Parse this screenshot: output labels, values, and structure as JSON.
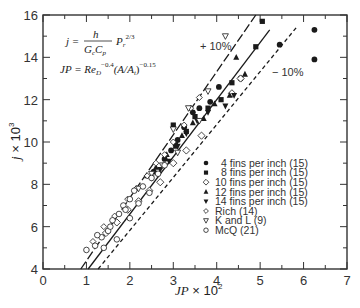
{
  "chart_data": {
    "type": "scatter",
    "title": "",
    "xlabel": "JP × 10²",
    "ylabel": "j × 10³",
    "xlim": [
      0,
      7
    ],
    "ylim": [
      4,
      16
    ],
    "xticks": [
      0,
      1,
      2,
      3,
      4,
      5,
      6,
      7
    ],
    "yticks": [
      4,
      6,
      8,
      10,
      12,
      14,
      16
    ],
    "grid": false,
    "legend_position": "lower right (inside)",
    "annotations": {
      "formula_j": "j = h / (G_c C_p) · P_r^(2/3)",
      "formula_jp": "JP = Re_D^-0.4 (A/A_t)^-0.15",
      "plus10": "+ 10%",
      "minus10": "− 10%"
    },
    "lines": [
      {
        "name": "+10%",
        "style": "long-dash",
        "x": [
          0.87,
          4.9
        ],
        "y": [
          4,
          16
        ]
      },
      {
        "name": "fit",
        "style": "solid",
        "x": [
          1.04,
          5.22
        ],
        "y": [
          4,
          15.3
        ]
      },
      {
        "name": "-10%",
        "style": "short-dash",
        "x": [
          1.27,
          5.83
        ],
        "y": [
          4,
          15.4
        ]
      }
    ],
    "series": [
      {
        "name": "4 fins per inch (15)",
        "marker": "circle-filled",
        "x": [
          2.55,
          2.8,
          2.95,
          3.1,
          3.25,
          3.45,
          3.6,
          3.85,
          4.05,
          4.55,
          5.45,
          6.25,
          6.25
        ],
        "y": [
          8.6,
          9.2,
          9.6,
          10.1,
          10.7,
          11.4,
          11.6,
          11.9,
          12.6,
          13.0,
          14.6,
          15.3,
          13.9
        ]
      },
      {
        "name": "8 fins per inch (15)",
        "marker": "square-filled",
        "x": [
          3.05,
          3.3,
          3.5,
          3.8,
          4.1,
          4.35,
          4.9,
          5.05,
          3.0
        ],
        "y": [
          9.9,
          10.5,
          11.2,
          11.6,
          12.0,
          12.8,
          14.5,
          15.7,
          10.8
        ]
      },
      {
        "name": "10 fins per inch (15)",
        "marker": "diamond-open",
        "x": [
          1.45,
          1.7,
          1.95,
          2.2,
          2.45,
          2.7,
          3.0,
          3.3,
          3.65,
          4.35,
          4.55
        ],
        "y": [
          5.7,
          6.2,
          6.8,
          7.2,
          7.7,
          8.1,
          9.0,
          9.6,
          10.3,
          12.3,
          13.0
        ]
      },
      {
        "name": "12 fins per inch (15)",
        "marker": "triangle-up-filled",
        "x": [
          2.4,
          2.6,
          2.85,
          3.05,
          3.2,
          3.45,
          3.7,
          3.95,
          4.3,
          4.65,
          4.45
        ],
        "y": [
          8.4,
          8.8,
          9.4,
          9.8,
          10.3,
          10.9,
          11.1,
          11.8,
          12.2,
          13.2,
          14.0
        ]
      },
      {
        "name": "14 fins per inch (15)",
        "marker": "triangle-down-filled",
        "x": [
          2.5,
          2.7,
          2.9,
          3.1,
          3.3,
          3.55,
          3.8,
          4.4,
          4.2
        ],
        "y": [
          8.3,
          8.7,
          9.1,
          9.8,
          10.4,
          11.0,
          11.4,
          12.2,
          11.7
        ]
      },
      {
        "name": "Rich (14)",
        "marker": "diamond-open-small",
        "x": [
          1.15,
          1.4,
          1.65,
          1.95,
          2.15,
          2.4,
          2.6,
          2.8,
          3.0,
          3.25,
          3.4,
          3.6
        ],
        "y": [
          5.3,
          6.0,
          6.5,
          7.3,
          7.8,
          8.4,
          9.0,
          9.4,
          10.0,
          10.8,
          11.6,
          12.1
        ]
      },
      {
        "name": "K and L (9)",
        "marker": "triangle-down-open",
        "x": [
          2.2,
          2.75,
          3.0,
          3.35,
          3.8,
          4.2,
          2.5,
          3.1,
          3.6
        ],
        "y": [
          7.8,
          8.9,
          10.6,
          11.6,
          12.4,
          15.0,
          8.5,
          9.5,
          11.0
        ]
      },
      {
        "name": "McQ (21)",
        "marker": "circle-open",
        "x": [
          1.0,
          1.2,
          1.35,
          1.5,
          1.6,
          1.75,
          1.85,
          2.0,
          2.1,
          2.3,
          2.5,
          2.65,
          2.8,
          1.25,
          1.55,
          1.9,
          2.2,
          2.45,
          1.4,
          1.7,
          2.0
        ],
        "y": [
          4.9,
          5.1,
          5.5,
          5.8,
          6.3,
          6.6,
          7.0,
          7.3,
          7.7,
          7.9,
          8.3,
          8.5,
          8.9,
          5.6,
          6.0,
          6.8,
          7.1,
          7.6,
          5.0,
          5.4,
          6.4
        ]
      }
    ]
  },
  "legend": {
    "items": [
      {
        "label": "4 fins per inch (15)",
        "marker": "circle-filled"
      },
      {
        "label": "8 fins per inch (15)",
        "marker": "square-filled"
      },
      {
        "label": "10 fins per inch (15)",
        "marker": "diamond-open"
      },
      {
        "label": "12 fins per inch (15)",
        "marker": "triangle-up-filled"
      },
      {
        "label": "14 fins per inch (15)",
        "marker": "triangle-down-filled"
      },
      {
        "label": "Rich (14)",
        "marker": "diamond-open-small"
      },
      {
        "label": "K and L (9)",
        "marker": "triangle-down-open"
      },
      {
        "label": "McQ (21)",
        "marker": "circle-open"
      }
    ]
  },
  "axes": {
    "x_title_main": "JP",
    "x_title_suffix": " × 10",
    "x_title_exp": "2",
    "y_title_main": "j",
    "y_title_suffix": " × 10",
    "y_title_exp": "3"
  },
  "formulas": {
    "j_lhs": "j = ",
    "j_num": "h",
    "j_den": "G",
    "j_den_sub": "c",
    "j_den2": "C",
    "j_den2_sub": "p",
    "j_rhs": "P",
    "j_rhs_sub": "r",
    "j_rhs_exp": "2/3",
    "jp_lhs": "JP = Re",
    "jp_sub": "D",
    "jp_exp": "−0.4",
    "jp_mid": "(A/A",
    "jp_mid_sub": "t",
    "jp_close": ")",
    "jp_exp2": "−0.15"
  },
  "labels": {
    "plus10": "+ 10%",
    "minus10": "− 10%"
  },
  "colors": {
    "ink": "#1a1a1a",
    "axis": "#333333",
    "background": "#ffffff"
  }
}
